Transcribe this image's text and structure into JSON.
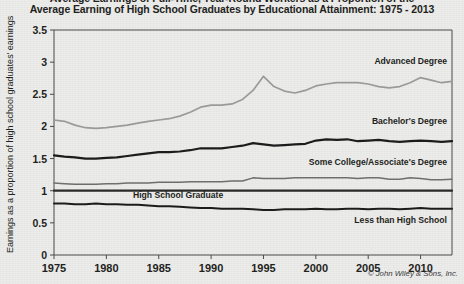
{
  "title": {
    "line1": "Average Earnings of Full-Time, Year-Round Workers as a Proportion of the",
    "line2": "Average Earning of High School Graduates by Educational Attainment: 1975 - 2013"
  },
  "credit": "© John Wiley & Sons, Inc.",
  "axes": {
    "ylabel": "Earnings as a proportion of high school graduates' earnings",
    "yticks": [
      "0",
      "0.5",
      "1",
      "1.5",
      "2",
      "2.5",
      "3",
      "3.5"
    ],
    "xticks": [
      "1975",
      "1980",
      "1985",
      "1990",
      "1995",
      "2000",
      "2005",
      "2010"
    ]
  },
  "series_labels": {
    "advanced": "Advanced Degree",
    "bachelors": "Bachelor's Degree",
    "some_college": "Some College/Associate's Degree",
    "hs_graduate": "High School Graduate",
    "less_than_hs": "Less than High School"
  },
  "colors": {
    "advanced": "#9a9a9a",
    "bachelors": "#1c1c1c",
    "some_college": "#6e6e6e",
    "hs_graduate": "#2a2a2a",
    "less_than_hs": "#1c1c1c",
    "axis": "#4a4a4a",
    "background": "#ececeb",
    "text": "#231f20"
  },
  "chart_data": {
    "type": "line",
    "title": "Average Earnings of Full-Time, Year-Round Workers as a Proportion of the Average Earning of High School Graduates by Educational Attainment: 1975 - 2013",
    "xlabel": "",
    "ylabel": "Earnings as a proportion of high school graduates' earnings",
    "xlim": [
      1975,
      2013
    ],
    "ylim": [
      0,
      3.5
    ],
    "yticks": [
      0,
      0.5,
      1,
      1.5,
      2,
      2.5,
      3,
      3.5
    ],
    "xticks": [
      1975,
      1980,
      1985,
      1990,
      1995,
      2000,
      2005,
      2010
    ],
    "grid": false,
    "legend": "inline-labels",
    "x": [
      1975,
      1976,
      1977,
      1978,
      1979,
      1980,
      1981,
      1982,
      1983,
      1984,
      1985,
      1986,
      1987,
      1988,
      1989,
      1990,
      1991,
      1992,
      1993,
      1994,
      1995,
      1996,
      1997,
      1998,
      1999,
      2000,
      2001,
      2002,
      2003,
      2004,
      2005,
      2006,
      2007,
      2008,
      2009,
      2010,
      2011,
      2012,
      2013
    ],
    "series": [
      {
        "name": "Advanced Degree",
        "color": "#9a9a9a",
        "values": [
          2.1,
          2.08,
          2.02,
          1.98,
          1.97,
          1.98,
          2.0,
          2.02,
          2.05,
          2.08,
          2.1,
          2.12,
          2.16,
          2.22,
          2.3,
          2.33,
          2.33,
          2.35,
          2.42,
          2.56,
          2.78,
          2.62,
          2.55,
          2.52,
          2.56,
          2.63,
          2.66,
          2.68,
          2.68,
          2.68,
          2.66,
          2.62,
          2.6,
          2.62,
          2.68,
          2.76,
          2.72,
          2.68,
          2.7
        ]
      },
      {
        "name": "Bachelor's Degree",
        "color": "#1c1c1c",
        "values": [
          1.55,
          1.53,
          1.52,
          1.5,
          1.5,
          1.51,
          1.52,
          1.54,
          1.56,
          1.58,
          1.6,
          1.6,
          1.61,
          1.63,
          1.66,
          1.66,
          1.66,
          1.68,
          1.7,
          1.74,
          1.72,
          1.7,
          1.71,
          1.72,
          1.73,
          1.78,
          1.8,
          1.79,
          1.8,
          1.77,
          1.78,
          1.79,
          1.77,
          1.76,
          1.77,
          1.78,
          1.77,
          1.76,
          1.77
        ]
      },
      {
        "name": "Some College/Associate's Degree",
        "color": "#6e6e6e",
        "values": [
          1.12,
          1.11,
          1.1,
          1.1,
          1.1,
          1.11,
          1.11,
          1.12,
          1.12,
          1.12,
          1.13,
          1.13,
          1.13,
          1.14,
          1.14,
          1.14,
          1.14,
          1.15,
          1.15,
          1.2,
          1.19,
          1.19,
          1.19,
          1.2,
          1.2,
          1.2,
          1.2,
          1.2,
          1.2,
          1.19,
          1.2,
          1.2,
          1.18,
          1.18,
          1.2,
          1.19,
          1.17,
          1.17,
          1.18
        ]
      },
      {
        "name": "High School Graduate",
        "color": "#2a2a2a",
        "values": [
          1.0,
          1.0,
          1.0,
          1.0,
          1.0,
          1.0,
          1.0,
          1.0,
          1.0,
          1.0,
          1.0,
          1.0,
          1.0,
          1.0,
          1.0,
          1.0,
          1.0,
          1.0,
          1.0,
          1.0,
          1.0,
          1.0,
          1.0,
          1.0,
          1.0,
          1.0,
          1.0,
          1.0,
          1.0,
          1.0,
          1.0,
          1.0,
          1.0,
          1.0,
          1.0,
          1.0,
          1.0,
          1.0,
          1.0
        ]
      },
      {
        "name": "Less than High School",
        "color": "#1c1c1c",
        "values": [
          0.8,
          0.8,
          0.79,
          0.79,
          0.8,
          0.79,
          0.79,
          0.78,
          0.78,
          0.77,
          0.76,
          0.76,
          0.75,
          0.74,
          0.73,
          0.73,
          0.72,
          0.72,
          0.72,
          0.71,
          0.7,
          0.7,
          0.71,
          0.71,
          0.71,
          0.72,
          0.71,
          0.71,
          0.72,
          0.72,
          0.71,
          0.72,
          0.72,
          0.71,
          0.72,
          0.73,
          0.72,
          0.72,
          0.72
        ]
      }
    ]
  }
}
